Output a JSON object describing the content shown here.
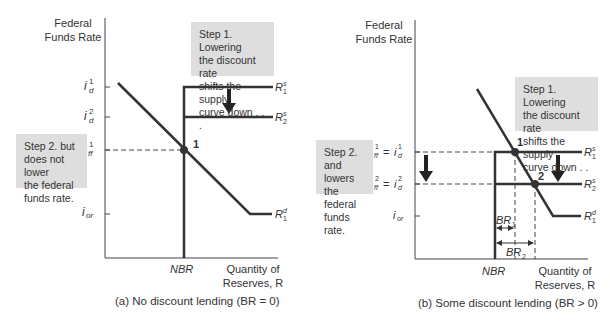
{
  "panel_a": {
    "y_axis_label_line1": "Federal",
    "y_axis_label_line2": "Funds Rate",
    "x_axis_label_line1": "Quantity of",
    "x_axis_label_line2": "Reserves, R",
    "nbr_label": "NBR",
    "caption": "(a) No discount lending (BR = 0)",
    "step1_box": [
      "Step 1. Lowering",
      "the discount rate",
      "shifts the supply",
      "curve down . . ."
    ],
    "step2_box": [
      "Step 2. but",
      "does not lower",
      "the federal",
      "funds rate."
    ],
    "y_ticks": [
      "i_d^1",
      "i_d^2",
      "i_ff^1",
      "i_or"
    ],
    "curves": [
      "R_1^s",
      "R_2^s",
      "R_1^d"
    ],
    "equilibrium_point": "1"
  },
  "panel_b": {
    "y_axis_label_line1": "Federal",
    "y_axis_label_line2": "Funds Rate",
    "x_axis_label_line1": "Quantity of",
    "x_axis_label_line2": "Reserves, R",
    "nbr_label": "NBR",
    "caption": "(b) Some discount lending (BR > 0)",
    "step1_box": [
      "Step 1. Lowering",
      "the discount rate",
      "shifts the supply",
      "curve down . . ."
    ],
    "step2_box": [
      "Step 2. and",
      "lowers the",
      "federal",
      "funds rate."
    ],
    "y_ticks": [
      "i_ff^1 = i_d^1",
      "i_ff^2 = i_d^2",
      "i_or"
    ],
    "curves": [
      "R_1^s",
      "R_2^s",
      "R_1^d"
    ],
    "equilibrium_points": [
      "1",
      "2"
    ],
    "borrowed_reserves": [
      "BR_1",
      "BR_2"
    ]
  }
}
